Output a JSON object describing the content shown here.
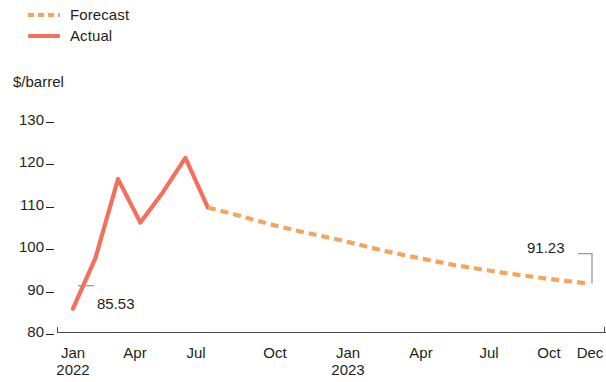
{
  "legend": {
    "position": "top-left",
    "items": [
      {
        "label": "Forecast",
        "style": "dashed",
        "color": "#F5A55C"
      },
      {
        "label": "Actual",
        "style": "solid",
        "color": "#F4705C"
      }
    ]
  },
  "axes": {
    "y_unit_label": "$/barrel",
    "y_ticks": [
      "130",
      "120",
      "110",
      "100",
      "90",
      "80"
    ],
    "x_ticks": [
      {
        "label": "Jan",
        "year": "2022"
      },
      {
        "label": "Apr",
        "year": ""
      },
      {
        "label": "Jul",
        "year": ""
      },
      {
        "label": "Oct",
        "year": ""
      },
      {
        "label": "Jan",
        "year": "2023"
      },
      {
        "label": "Apr",
        "year": ""
      },
      {
        "label": "Jul",
        "year": ""
      },
      {
        "label": "Oct",
        "year": ""
      },
      {
        "label": "Dec",
        "year": ""
      }
    ]
  },
  "callouts": {
    "start_value": "85.53",
    "end_value": "91.23"
  },
  "chart_data": {
    "type": "line",
    "title": "",
    "subtitle": "",
    "xlabel": "",
    "ylabel": "$/barrel",
    "ylim": [
      80,
      130
    ],
    "yticks": [
      80,
      90,
      100,
      110,
      120,
      130
    ],
    "grid": false,
    "legend_position": "top-left",
    "x": [
      "2022-01",
      "2022-02",
      "2022-03",
      "2022-04",
      "2022-05",
      "2022-06",
      "2022-07",
      "2022-08",
      "2022-09",
      "2022-10",
      "2022-11",
      "2022-12",
      "2023-01",
      "2023-02",
      "2023-03",
      "2023-04",
      "2023-05",
      "2023-06",
      "2023-07",
      "2023-08",
      "2023-09",
      "2023-10",
      "2023-11",
      "2023-12"
    ],
    "series": [
      {
        "name": "Actual",
        "style": "solid",
        "color": "#F4705C",
        "values": [
          85.53,
          97.1,
          115.0,
          105.1,
          112.0,
          119.8,
          108.5,
          null,
          null,
          null,
          null,
          null,
          null,
          null,
          null,
          null,
          null,
          null,
          null,
          null,
          null,
          null,
          null,
          null
        ]
      },
      {
        "name": "Forecast",
        "style": "dashed",
        "color": "#F5A55C",
        "values": [
          null,
          null,
          null,
          null,
          null,
          null,
          108.5,
          107.2,
          105.8,
          104.4,
          103.2,
          102.1,
          101.0,
          99.7,
          98.5,
          97.4,
          96.4,
          95.4,
          94.6,
          93.8,
          93.1,
          92.4,
          91.8,
          91.23
        ]
      }
    ],
    "annotations": [
      {
        "text": "85.53",
        "x": "2022-01",
        "y": 85.53,
        "leader": "horizontal-left"
      },
      {
        "text": "91.23",
        "x": "2023-12",
        "y": 91.23,
        "leader": "bracket-right"
      }
    ]
  }
}
